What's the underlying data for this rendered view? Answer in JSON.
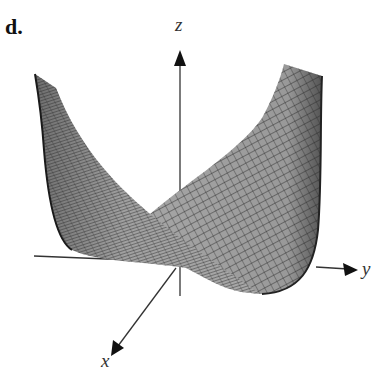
{
  "figure": {
    "panel_label": "d.",
    "type": "3D surface plot",
    "axes": {
      "x_label": "x",
      "y_label": "y",
      "z_label": "z"
    },
    "colors": {
      "surface_fill": "#9a9a9a",
      "mesh_lines": "#2a2a2a",
      "axis": "#333333",
      "background": "#ffffff"
    }
  }
}
